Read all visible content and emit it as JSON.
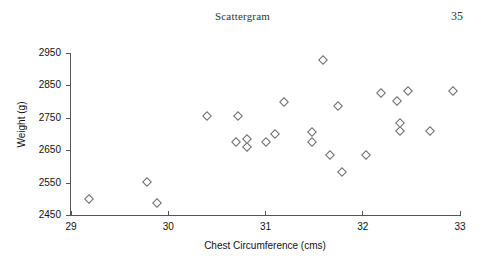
{
  "header": {
    "title": "Scattergram",
    "page_number": "35"
  },
  "chart_data": {
    "type": "scatter",
    "title": "Scattergram",
    "xlabel": "Chest Circumference (cms)",
    "ylabel": "Weight (g)",
    "xlim": [
      29,
      33
    ],
    "ylim": [
      2450,
      2950
    ],
    "xticks": [
      29,
      30,
      31,
      32,
      33
    ],
    "xtick_labels": [
      "29",
      "30",
      "31",
      "32",
      "33"
    ],
    "yticks": [
      2450,
      2550,
      2650,
      2750,
      2850,
      2950
    ],
    "ytick_labels": [
      "2450",
      "2550",
      "2650",
      "2750",
      "2850",
      "2950"
    ],
    "grid": false,
    "legend": null,
    "marker": "open-diamond",
    "marker_color": "#6a6a6a",
    "series": [
      {
        "name": "Infants",
        "points": [
          {
            "x": 29.19,
            "y": 2500
          },
          {
            "x": 29.79,
            "y": 2553
          },
          {
            "x": 29.89,
            "y": 2487
          },
          {
            "x": 30.4,
            "y": 2757
          },
          {
            "x": 30.7,
            "y": 2674
          },
          {
            "x": 30.72,
            "y": 2757
          },
          {
            "x": 30.82,
            "y": 2684
          },
          {
            "x": 30.82,
            "y": 2660
          },
          {
            "x": 31.01,
            "y": 2674
          },
          {
            "x": 31.1,
            "y": 2700
          },
          {
            "x": 31.2,
            "y": 2800
          },
          {
            "x": 31.48,
            "y": 2707
          },
          {
            "x": 31.48,
            "y": 2676
          },
          {
            "x": 31.6,
            "y": 2929
          },
          {
            "x": 31.67,
            "y": 2636
          },
          {
            "x": 31.75,
            "y": 2786
          },
          {
            "x": 31.79,
            "y": 2584
          },
          {
            "x": 32.04,
            "y": 2634
          },
          {
            "x": 32.19,
            "y": 2826
          },
          {
            "x": 32.36,
            "y": 2801
          },
          {
            "x": 32.39,
            "y": 2733
          },
          {
            "x": 32.39,
            "y": 2708
          },
          {
            "x": 32.47,
            "y": 2833
          },
          {
            "x": 32.7,
            "y": 2708
          },
          {
            "x": 32.93,
            "y": 2833
          }
        ]
      }
    ]
  }
}
